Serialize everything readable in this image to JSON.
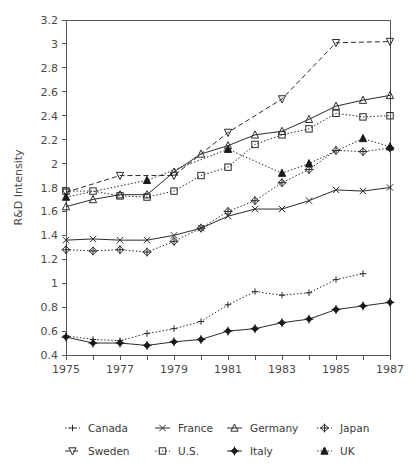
{
  "chart_data": {
    "type": "line",
    "title": "",
    "xlabel": "",
    "ylabel": "R&D Intensity",
    "xlim": [
      1975,
      1987
    ],
    "ylim": [
      0.4,
      3.2
    ],
    "grid": false,
    "legend_position": "bottom",
    "x_ticks": [
      1975,
      1976,
      1977,
      1978,
      1979,
      1980,
      1981,
      1982,
      1983,
      1984,
      1985,
      1986,
      1987
    ],
    "x_tick_labels": [
      "1975",
      "",
      "1977",
      "",
      "1979",
      "",
      "1981",
      "",
      "1983",
      "",
      "1985",
      "",
      "1987"
    ],
    "y_ticks": [
      0.4,
      0.6,
      0.8,
      1.0,
      1.2,
      1.4,
      1.6,
      1.8,
      2.0,
      2.2,
      2.4,
      2.6,
      2.8,
      3.0,
      3.2
    ],
    "y_tick_labels": [
      "0.4",
      "0.6",
      "0.8",
      "1",
      "1.2",
      "1.4",
      "1.6",
      "1.8",
      "2",
      "2.2",
      "2.4",
      "2.6",
      "2.8",
      "3",
      "3.2"
    ],
    "series": [
      {
        "name": "Canada",
        "marker": "plus",
        "dash": "dotted",
        "x": [
          1975,
          1976,
          1977,
          1978,
          1979,
          1980,
          1981,
          1982,
          1983,
          1984,
          1985,
          1986
        ],
        "values": [
          0.56,
          0.53,
          0.52,
          0.58,
          0.62,
          0.68,
          0.82,
          0.93,
          0.9,
          0.92,
          1.03,
          1.08
        ]
      },
      {
        "name": "France",
        "marker": "x",
        "dash": "solid",
        "x": [
          1975,
          1976,
          1977,
          1978,
          1979,
          1980,
          1981,
          1982,
          1983,
          1984,
          1985,
          1986,
          1987
        ],
        "values": [
          1.36,
          1.37,
          1.36,
          1.36,
          1.4,
          1.46,
          1.56,
          1.62,
          1.62,
          1.69,
          1.78,
          1.77,
          1.8
        ]
      },
      {
        "name": "Germany",
        "marker": "triangle-open",
        "dash": "solid",
        "x": [
          1975,
          1976,
          1977,
          1978,
          1979,
          1980,
          1981,
          1982,
          1983,
          1984,
          1985,
          1986,
          1987
        ],
        "values": [
          1.64,
          1.7,
          1.74,
          1.74,
          1.93,
          2.08,
          2.15,
          2.24,
          2.27,
          2.37,
          2.48,
          2.53,
          2.57
        ]
      },
      {
        "name": "Japan",
        "marker": "diamond-open",
        "dash": "dotted",
        "x": [
          1975,
          1976,
          1977,
          1978,
          1979,
          1980,
          1981,
          1982,
          1983,
          1984,
          1985,
          1986,
          1987
        ],
        "values": [
          1.28,
          1.27,
          1.28,
          1.26,
          1.35,
          1.46,
          1.6,
          1.69,
          1.84,
          1.95,
          2.11,
          2.1,
          2.13
        ]
      },
      {
        "name": "Sweden",
        "marker": "triangle-down-open",
        "dash": "dashed",
        "x": [
          1975,
          1977,
          1979,
          1981,
          1983,
          1985,
          1987
        ],
        "values": [
          1.76,
          1.9,
          1.9,
          2.26,
          2.54,
          3.01,
          3.02
        ]
      },
      {
        "name": "U.S.",
        "marker": "square-open",
        "dash": "dotted",
        "x": [
          1975,
          1976,
          1977,
          1978,
          1979,
          1980,
          1981,
          1982,
          1983,
          1984,
          1985,
          1986,
          1987
        ],
        "values": [
          1.77,
          1.77,
          1.73,
          1.72,
          1.77,
          1.9,
          1.97,
          2.16,
          2.24,
          2.29,
          2.42,
          2.39,
          2.4
        ]
      },
      {
        "name": "Italy",
        "marker": "diamond-filled",
        "dash": "solid",
        "x": [
          1975,
          1976,
          1977,
          1978,
          1979,
          1980,
          1981,
          1982,
          1983,
          1984,
          1985,
          1986,
          1987
        ],
        "values": [
          0.55,
          0.5,
          0.5,
          0.48,
          0.51,
          0.53,
          0.6,
          0.62,
          0.67,
          0.7,
          0.78,
          0.81,
          0.84
        ]
      },
      {
        "name": "UK",
        "marker": "triangle-filled",
        "dash": "dotted",
        "x": [
          1975,
          1978,
          1981,
          1983,
          1984,
          1986,
          1987
        ],
        "values": [
          1.72,
          1.86,
          2.12,
          1.92,
          2.0,
          2.21,
          2.14
        ]
      }
    ]
  },
  "legend": {
    "rows": [
      [
        "Canada",
        "France",
        "Germany",
        "Japan"
      ],
      [
        "Sweden",
        "U.S.",
        "Italy",
        "UK"
      ]
    ],
    "entries": [
      {
        "label": "Canada",
        "marker": "plus",
        "dash": "dotted"
      },
      {
        "label": "France",
        "marker": "x",
        "dash": "solid"
      },
      {
        "label": "Germany",
        "marker": "triangle-open",
        "dash": "solid"
      },
      {
        "label": "Japan",
        "marker": "diamond-open",
        "dash": "dotted"
      },
      {
        "label": "Sweden",
        "marker": "triangle-down-open",
        "dash": "dashed"
      },
      {
        "label": "U.S.",
        "marker": "square-open",
        "dash": "dotted"
      },
      {
        "label": "Italy",
        "marker": "diamond-filled",
        "dash": "solid"
      },
      {
        "label": "UK",
        "marker": "triangle-filled",
        "dash": "dotted"
      }
    ]
  },
  "colors": {
    "line": "#2b2b2b",
    "axis": "#555555",
    "text": "#3a3a3a",
    "background": "#ffffff"
  }
}
